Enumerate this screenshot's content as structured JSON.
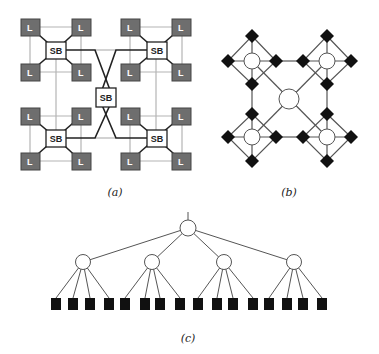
{
  "figures": {
    "a": {
      "caption": "(a)",
      "leaf_label": "L",
      "switch_label": "SB",
      "center_switch_label": "SB",
      "colors": {
        "leaf_fill": "#6e6e6e",
        "leaf_border": "#444444",
        "switch_fill": "#ffffff",
        "gray_line": "#b4b4b4",
        "black_line": "#222222"
      }
    },
    "b": {
      "caption": "(b)",
      "colors": {
        "diamond_fill": "#111111",
        "circle_fill": "#ffffff",
        "line": "#555555"
      }
    },
    "c": {
      "caption": "(c)",
      "root_count": 1,
      "mid_node_count": 4,
      "leaf_count": 16,
      "colors": {
        "leaf_fill": "#111111",
        "node_fill": "#ffffff",
        "line": "#555555"
      }
    }
  }
}
